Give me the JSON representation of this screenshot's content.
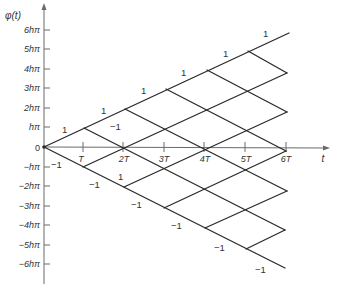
{
  "diagram": {
    "y_axis": {
      "title": "φ(t)",
      "ticks": [
        {
          "label": "6hπ",
          "y": 30
        },
        {
          "label": "5hπ",
          "y": 49
        },
        {
          "label": "4hπ",
          "y": 69
        },
        {
          "label": "3hπ",
          "y": 88
        },
        {
          "label": "2hπ",
          "y": 108
        },
        {
          "label": "hπ",
          "y": 127
        },
        {
          "label": "0",
          "y": 147
        },
        {
          "label": "−hπ",
          "y": 167
        },
        {
          "label": "−2hπ",
          "y": 186
        },
        {
          "label": "−3hπ",
          "y": 206
        },
        {
          "label": "−4hπ",
          "y": 225
        },
        {
          "label": "−5hπ",
          "y": 245
        },
        {
          "label": "−6hπ",
          "y": 264
        }
      ]
    },
    "x_axis": {
      "title": "t",
      "ticks": [
        {
          "label": "T",
          "x": 83
        },
        {
          "label": "2T",
          "x": 123
        },
        {
          "label": "3T",
          "x": 164
        },
        {
          "label": "4T",
          "x": 204
        },
        {
          "label": "5T",
          "x": 245
        },
        {
          "label": "6T",
          "x": 286
        }
      ]
    },
    "edge_labels": [
      {
        "text": "1",
        "x": 62,
        "y": 133
      },
      {
        "text": "1",
        "x": 101,
        "y": 114
      },
      {
        "text": "1",
        "x": 141,
        "y": 94
      },
      {
        "text": "1",
        "x": 181,
        "y": 76
      },
      {
        "text": "1",
        "x": 223,
        "y": 57
      },
      {
        "text": "1",
        "x": 263,
        "y": 37
      },
      {
        "text": "−1",
        "x": 113,
        "y": 130
      },
      {
        "text": "1",
        "x": 120,
        "y": 179
      },
      {
        "text": "−1",
        "x": 53,
        "y": 168
      },
      {
        "text": "−1",
        "x": 91,
        "y": 188
      },
      {
        "text": "−1",
        "x": 133,
        "y": 208
      },
      {
        "text": "−1",
        "x": 173,
        "y": 229
      },
      {
        "text": "−1",
        "x": 216,
        "y": 251
      },
      {
        "text": "−1",
        "x": 257,
        "y": 273
      }
    ],
    "caption": "Phase trellis φ(t) with branch labels ±1"
  }
}
